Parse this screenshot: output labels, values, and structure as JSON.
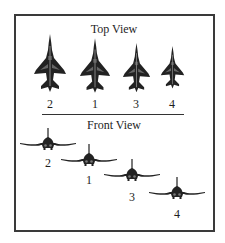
{
  "diagram": {
    "top_view": {
      "title": "Top View",
      "aircraft": [
        {
          "label": "2",
          "cx": 50,
          "nose_y": 35,
          "scale": 1.0
        },
        {
          "label": "1",
          "cx": 95,
          "nose_y": 39,
          "scale": 0.95
        },
        {
          "label": "3",
          "cx": 136,
          "nose_y": 43,
          "scale": 0.85
        },
        {
          "label": "4",
          "cx": 172,
          "nose_y": 46,
          "scale": 0.75
        }
      ]
    },
    "front_view": {
      "title": "Front View",
      "aircraft": [
        {
          "label": "2",
          "cx": 48,
          "fin_top_y": 129
        },
        {
          "label": "1",
          "cx": 89,
          "fin_top_y": 145
        },
        {
          "label": "3",
          "cx": 132,
          "fin_top_y": 160
        },
        {
          "label": "4",
          "cx": 177,
          "fin_top_y": 178
        }
      ]
    },
    "colors": {
      "border": "#3a3a3a",
      "aircraft": "#222222",
      "text": "#1e1e1e"
    }
  }
}
